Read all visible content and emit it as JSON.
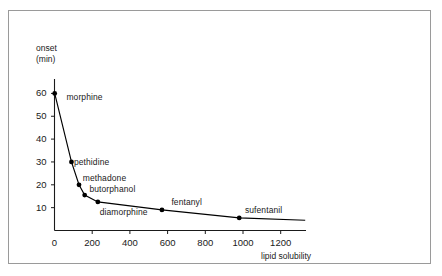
{
  "figure": {
    "border_color": "#9a9a9a",
    "background": "#ffffff"
  },
  "axes": {
    "y_title_line1": "onset",
    "y_title_line2": "(min)",
    "x_title": "lipid solubility",
    "y_ticks": [
      "10",
      "20",
      "30",
      "40",
      "50",
      "60"
    ],
    "x_ticks": [
      "0",
      "200",
      "400",
      "600",
      "800",
      "1000",
      "1200"
    ]
  },
  "chart_data": {
    "type": "line",
    "title": "",
    "xlabel": "lipid solubility",
    "ylabel": "onset (min)",
    "xlim": [
      0,
      1330
    ],
    "ylim": [
      0,
      65
    ],
    "grid": false,
    "legend": "none",
    "line_color": "#000000",
    "marker_color": "#000000",
    "series": [
      {
        "name": "opioid onset vs lipid solubility",
        "points": [
          {
            "label": "morphine",
            "x": 1,
            "y": 60
          },
          {
            "label": "pethidine",
            "x": 90,
            "y": 30
          },
          {
            "label": "methadone",
            "x": 130,
            "y": 20
          },
          {
            "label": "butorphanol",
            "x": 160,
            "y": 15.5
          },
          {
            "label": "diamorphine",
            "x": 230,
            "y": 12.5
          },
          {
            "label": "fentanyl",
            "x": 570,
            "y": 9
          },
          {
            "label": "sufentanil",
            "x": 980,
            "y": 5.5
          }
        ],
        "tail_x": 1330,
        "tail_y": 4.5
      }
    ],
    "annotations": [
      {
        "text": "morphine",
        "x": 63,
        "y": 58,
        "anchor": "left"
      },
      {
        "text": "pethidine",
        "x": 103,
        "y": 29.5,
        "anchor": "left"
      },
      {
        "text": "methadone",
        "x": 150,
        "y": 22.5,
        "anchor": "left"
      },
      {
        "text": "butorphanol",
        "x": 185,
        "y": 17.5,
        "anchor": "left"
      },
      {
        "text": "diamorphine",
        "x": 240,
        "y": 7.5,
        "anchor": "left"
      },
      {
        "text": "fentanyl",
        "x": 620,
        "y": 12,
        "anchor": "left"
      },
      {
        "text": "sufentanil",
        "x": 1010,
        "y": 8.5,
        "anchor": "left"
      }
    ]
  }
}
